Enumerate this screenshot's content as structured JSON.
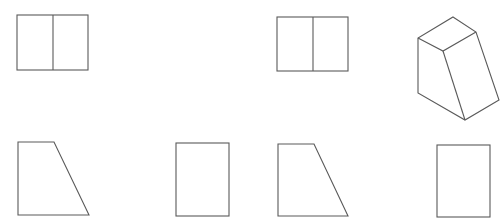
{
  "figure": {
    "stroke_color": "#5a5a5a",
    "background": "#ffffff",
    "top_text_cut_off": true,
    "top_row": [
      {
        "id": "view-a-top",
        "kind": "rect-split",
        "x": 17,
        "y": 15,
        "w": 71,
        "h": 55,
        "divider_x": 53
      },
      {
        "id": "view-b-top",
        "kind": "rect-split",
        "x": 277,
        "y": 17,
        "w": 71,
        "h": 54,
        "divider_x": 313
      },
      {
        "id": "isometric-solid",
        "kind": "isometric",
        "points": {
          "top": [
            453,
            17
          ],
          "left_top": [
            418,
            38
          ],
          "inner_front": [
            443,
            51
          ],
          "right_top": [
            476,
            32
          ],
          "left_bottom": [
            418,
            93
          ],
          "bottom": [
            465,
            120
          ],
          "right_bottom": [
            499,
            100
          ]
        }
      }
    ],
    "bottom_row": [
      {
        "id": "view-a-front",
        "kind": "trapezoid",
        "points": [
          [
            18,
            142
          ],
          [
            54,
            142
          ],
          [
            89,
            215
          ],
          [
            18,
            215
          ]
        ]
      },
      {
        "id": "view-a-side",
        "kind": "rect",
        "x": 176,
        "y": 143,
        "w": 53,
        "h": 73
      },
      {
        "id": "view-b-front",
        "kind": "trapezoid",
        "points": [
          [
            278,
            144
          ],
          [
            314,
            144
          ],
          [
            348,
            216
          ],
          [
            278,
            216
          ]
        ]
      },
      {
        "id": "view-b-side",
        "kind": "rect",
        "x": 437,
        "y": 145,
        "w": 53,
        "h": 72
      }
    ]
  }
}
